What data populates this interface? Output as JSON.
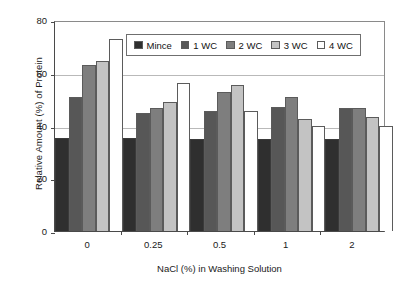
{
  "chart_data": {
    "type": "bar",
    "title": "",
    "xlabel": "NaCl (%) in Washing Solution",
    "ylabel": "Relative Amount (%) of Protein",
    "categories": [
      "0",
      "0.25",
      "0.5",
      "1",
      "2"
    ],
    "ylim": [
      0,
      80
    ],
    "yticks": [
      0,
      20,
      40,
      60,
      80
    ],
    "grid": true,
    "legend_position": "top-center-inside",
    "series": [
      {
        "name": "Mince",
        "color": "#2f2f2f",
        "values": [
          35.2,
          35.2,
          35.0,
          35.0,
          35.0
        ]
      },
      {
        "name": "1 WC",
        "color": "#575757",
        "values": [
          50.8,
          44.6,
          45.6,
          47.0,
          46.6
        ]
      },
      {
        "name": "2 WC",
        "color": "#7e7e7e",
        "values": [
          63.0,
          46.8,
          52.8,
          51.0,
          46.8
        ]
      },
      {
        "name": "3 WC",
        "color": "#c3c3c3",
        "values": [
          64.6,
          48.8,
          55.2,
          42.6,
          43.2
        ]
      },
      {
        "name": "4 WC",
        "color": "#ffffff",
        "values": [
          72.8,
          56.2,
          45.6,
          40.0,
          39.8
        ]
      }
    ]
  },
  "legend": {
    "items": [
      {
        "label": "Mince",
        "swatch": "#2f2f2f"
      },
      {
        "label": "1 WC",
        "swatch": "#575757"
      },
      {
        "label": "2 WC",
        "swatch": "#7e7e7e"
      },
      {
        "label": "3 WC",
        "swatch": "#c3c3c3"
      },
      {
        "label": "4 WC",
        "swatch": "#ffffff"
      }
    ]
  },
  "axes": {
    "y_tick_labels": [
      "80",
      "60",
      "40",
      "20",
      "0"
    ],
    "x_tick_labels": [
      "0",
      "0.25",
      "0.5",
      "1",
      "2"
    ],
    "y_title": "Relative Amount (%) of Protein",
    "x_title": "NaCl (%) in Washing Solution"
  },
  "style": {
    "axis_color": "#4a4a4a",
    "grid_color": "#b9b9b9",
    "bar_border": "#5b5b5b",
    "background": "#ffffff"
  }
}
